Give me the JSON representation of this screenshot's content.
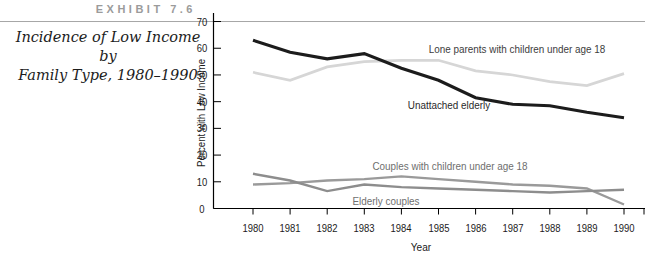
{
  "exhibit": {
    "label": "EXHIBIT 7.6"
  },
  "title": {
    "line1": "Incidence of Low Income by",
    "line2": "Family Type, 1980–1990"
  },
  "chart_data": {
    "type": "line",
    "x": [
      1980,
      1981,
      1982,
      1983,
      1984,
      1985,
      1986,
      1987,
      1988,
      1989,
      1990
    ],
    "xlabel": "Year",
    "ylabel": "Percent with Low Income",
    "ylim": [
      0,
      70
    ],
    "yticks": [
      0,
      10,
      20,
      30,
      40,
      50,
      60,
      70
    ],
    "grid": false,
    "legend_position": "inline-annotations",
    "series": [
      {
        "name": "Lone parents with children under age 18",
        "color": "#d6d6d6",
        "values": [
          51,
          48,
          53,
          55,
          55.5,
          55.5,
          51.5,
          50,
          47.5,
          46,
          50.5
        ]
      },
      {
        "name": "Couples with children under age 18",
        "color": "#9a9a9a",
        "values": [
          9,
          9.5,
          10.5,
          11,
          12,
          11,
          10,
          9,
          8.5,
          7.5,
          1.5
        ]
      },
      {
        "name": "Elderly couples",
        "color": "#8d8d8d",
        "values": [
          13,
          10.5,
          6.5,
          9,
          8,
          7.5,
          7,
          6.5,
          6,
          6.5,
          7
        ]
      },
      {
        "name": "Unattached elderly",
        "color": "#1c1c1c",
        "values": [
          63,
          58.5,
          56,
          58,
          52.5,
          48,
          41.5,
          39,
          38.5,
          36,
          34
        ]
      }
    ],
    "colors": {
      "axis": "#000000",
      "top_rule": "#a6a6a6",
      "text": "#1b1b1b"
    }
  }
}
